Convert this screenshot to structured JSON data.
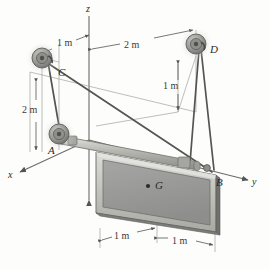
{
  "figure": {
    "background": "#fdfdfc",
    "line_color": "#4a4a4a",
    "plate_face_color": "#9a9a9a",
    "plate_frame_color": "#c9c9c4",
    "pulley_color": "#8d8d8d"
  },
  "axes": [
    {
      "name": "z-axis",
      "label": "z",
      "x": 86,
      "y": 4
    },
    {
      "name": "x-axis",
      "label": "x",
      "x": 8,
      "y": 170
    },
    {
      "name": "y-axis",
      "label": "y",
      "x": 252,
      "y": 177
    }
  ],
  "points": [
    {
      "name": "point-C",
      "label": "C",
      "x": 58,
      "y": 67
    },
    {
      "name": "point-D",
      "label": "D",
      "x": 210,
      "y": 44
    },
    {
      "name": "point-A",
      "label": "A",
      "x": 48,
      "y": 145
    },
    {
      "name": "point-B",
      "label": "B",
      "x": 216,
      "y": 177
    },
    {
      "name": "point-G",
      "label": "G",
      "x": 155,
      "y": 186
    }
  ],
  "dimensions": [
    {
      "name": "dim-top-left-1m",
      "label": "1 m",
      "x": 57,
      "y": 38
    },
    {
      "name": "dim-top-right-2m",
      "label": "2 m",
      "x": 128,
      "y": 40
    },
    {
      "name": "dim-left-2m",
      "label": "2 m",
      "x": 22,
      "y": 110
    },
    {
      "name": "dim-right-1m",
      "label": "1 m",
      "x": 160,
      "y": 85
    },
    {
      "name": "dim-bottom-left-1m",
      "label": "1 m",
      "x": 113,
      "y": 229
    },
    {
      "name": "dim-bottom-right-1m",
      "label": "1 m",
      "x": 171,
      "y": 238
    }
  ],
  "pulleys": [
    {
      "name": "pulley-C",
      "cx": 42,
      "cy": 58,
      "r": 10
    },
    {
      "name": "pulley-D",
      "cx": 196,
      "cy": 44,
      "r": 10
    },
    {
      "name": "pulley-A",
      "cx": 59,
      "cy": 134,
      "r": 10
    }
  ]
}
